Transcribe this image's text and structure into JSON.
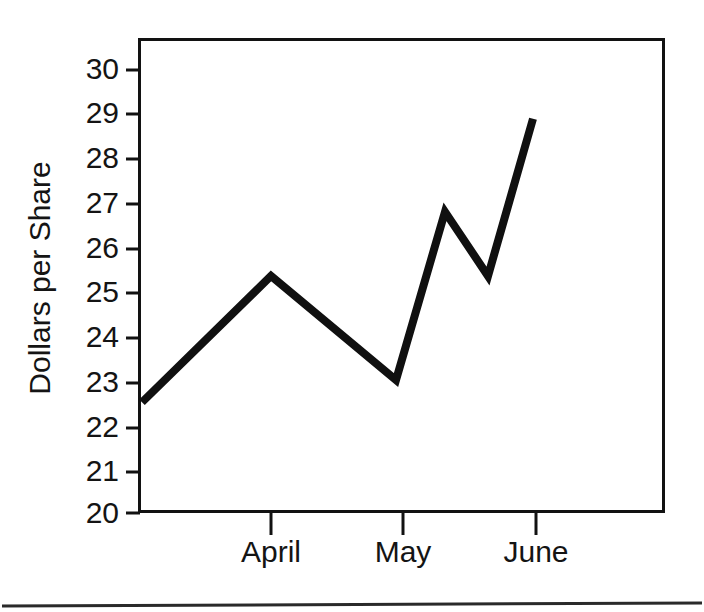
{
  "chart_data": {
    "type": "line",
    "title": "",
    "xlabel": "",
    "ylabel": "Dollars per Share",
    "ylim": [
      20,
      30
    ],
    "yticks": [
      20,
      21,
      22,
      23,
      24,
      25,
      26,
      27,
      28,
      29,
      30
    ],
    "ytick_labels": [
      "20",
      "21",
      "22",
      "23",
      "24",
      "25",
      "26",
      "27",
      "28",
      "29",
      "30"
    ],
    "categories": [
      "April",
      "May",
      "June"
    ],
    "category_positions": [
      271,
      403,
      536
    ],
    "grid": false,
    "legend": null,
    "series": [
      {
        "name": "Dollars per Share",
        "x": [
          142,
          271,
          396,
          445,
          488,
          533
        ],
        "values": [
          22.5,
          25.35,
          23.0,
          26.8,
          25.35,
          28.9
        ],
        "color": "#101010"
      }
    ],
    "annotations": []
  },
  "axis": {
    "y_title": "Dollars per Share",
    "y_ticks": [
      "30",
      "29",
      "28",
      "27",
      "26",
      "25",
      "24",
      "23",
      "22",
      "21",
      "20"
    ],
    "x_ticks": [
      "April",
      "May",
      "June"
    ]
  },
  "colors": {
    "line": "#101010",
    "frame": "#121212",
    "text": "#141414",
    "background": "#ffffff",
    "footer_rule": "#2a2a2a"
  }
}
